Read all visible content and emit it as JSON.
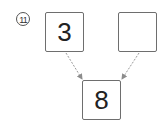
{
  "problem": {
    "number_label": "11",
    "boxes": {
      "top_left": "3",
      "top_right": "",
      "bottom": "8"
    }
  },
  "colors": {
    "box_border": "#6e6e6e",
    "arrow": "#8c8c8c",
    "text": "#222222"
  }
}
